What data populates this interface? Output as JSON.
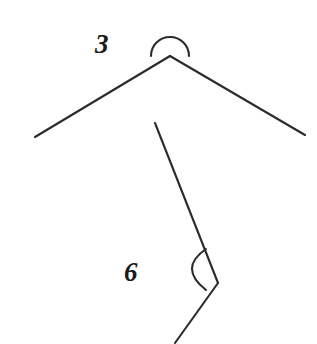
{
  "figure": {
    "kind": "geometry-angle-diagram",
    "width": 317,
    "height": 344,
    "background_color": "#ffffff",
    "stroke_color": "#2b2b2b",
    "text_color": "#1a1a1a",
    "stroke_width": 2.1
  },
  "labels": {
    "top_angle": "3",
    "bottom_angle": "6"
  },
  "angles": [
    {
      "id": "top-angle",
      "label": "3",
      "vertex": {
        "x": 170,
        "y": 56
      },
      "rays": [
        {
          "id": "top-left-ray",
          "from": {
            "x": 170,
            "y": 56
          },
          "to": {
            "x": 35,
            "y": 137
          }
        },
        {
          "id": "top-right-ray",
          "from": {
            "x": 170,
            "y": 56
          },
          "to": {
            "x": 305,
            "y": 135
          }
        }
      ],
      "marker": {
        "type": "semicircle-arc",
        "center": {
          "x": 170,
          "y": 56
        },
        "radius": 19,
        "side": "above",
        "start": {
          "x": 151,
          "y": 56
        },
        "end": {
          "x": 189,
          "y": 56
        }
      },
      "label_position": {
        "x": 95,
        "y": 31
      }
    },
    {
      "id": "bottom-angle",
      "label": "6",
      "vertex": {
        "x": 218,
        "y": 283
      },
      "rays": [
        {
          "id": "bottom-upper-ray",
          "from": {
            "x": 218,
            "y": 283
          },
          "to": {
            "x": 155,
            "y": 123
          }
        },
        {
          "id": "bottom-lower-ray",
          "from": {
            "x": 218,
            "y": 283
          },
          "to": {
            "x": 175,
            "y": 343
          }
        }
      ],
      "marker": {
        "type": "bulging-arc",
        "start": {
          "x": 206,
          "y": 249
        },
        "end": {
          "x": 206,
          "y": 290
        },
        "control": {
          "x": 178,
          "y": 268
        },
        "side": "left"
      },
      "label_position": {
        "x": 124,
        "y": 259
      }
    }
  ]
}
